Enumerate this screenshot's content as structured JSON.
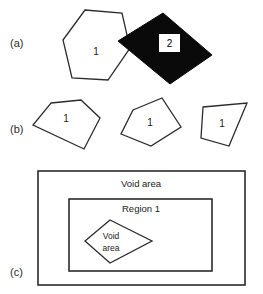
{
  "figure": {
    "background_color": "#ffffff",
    "stroke_color": "#2b2b2b",
    "fill_black": "#0a0a0a"
  },
  "panels": {
    "a": {
      "label": "(a)",
      "shapes": [
        {
          "name": "hexagon",
          "label": "1",
          "style": "outline"
        },
        {
          "name": "black-quadrilateral",
          "label": "2",
          "style": "filled"
        }
      ]
    },
    "b": {
      "label": "(b)",
      "shapes": [
        {
          "name": "pentagon-left",
          "label": "1",
          "style": "outline"
        },
        {
          "name": "pentagon-middle",
          "label": "1",
          "style": "outline"
        },
        {
          "name": "quadrilateral-right",
          "label": "1",
          "style": "outline"
        }
      ]
    },
    "c": {
      "label": "(c)",
      "outer_rect_label": "Void area",
      "inner_rect_label": "Region 1",
      "diamond_label_line1": "Void",
      "diamond_label_line2": "area"
    }
  }
}
